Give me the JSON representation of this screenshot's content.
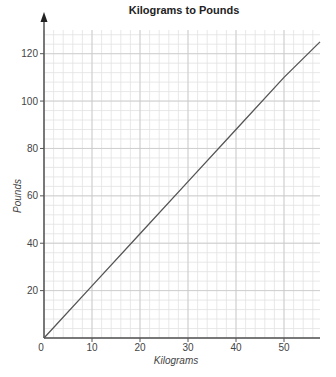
{
  "chart_data": {
    "type": "line",
    "title": "Kilograms to Pounds",
    "xlabel": "Kilograms",
    "ylabel": "Pounds",
    "x_ticks": [
      "0",
      "10",
      "20",
      "30",
      "40",
      "50"
    ],
    "y_ticks": [
      "20",
      "40",
      "60",
      "80",
      "100",
      "120"
    ],
    "xlim": [
      0,
      57.5
    ],
    "ylim": [
      0,
      130
    ],
    "grid": true,
    "series": [
      {
        "name": "Kilograms to Pounds",
        "x": [
          0,
          10,
          20,
          30,
          40,
          50,
          57.5
        ],
        "y": [
          0,
          22,
          44,
          66,
          88,
          110,
          125
        ]
      }
    ],
    "colors": {
      "line": "#555555",
      "grid_minor": "#e2e2e2",
      "grid_major": "#c8c8c8",
      "axis": "#555555"
    }
  }
}
